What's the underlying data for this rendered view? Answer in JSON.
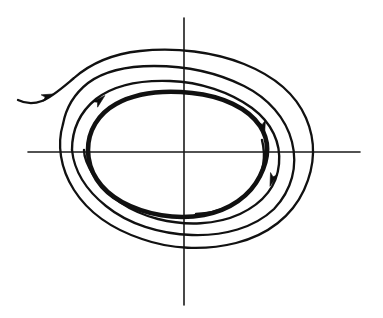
{
  "figure": {
    "background_color": "#ffffff",
    "stroke_color": "#111111",
    "width": 383,
    "height": 318
  },
  "axes": {
    "origin": {
      "x": 184,
      "y": 152
    },
    "horizontal": {
      "name": "x-axis",
      "x_start": 28,
      "x_end": 360,
      "y": 152,
      "label": "",
      "color": "#1a1a1a",
      "stroke_width": 1.6
    },
    "vertical": {
      "name": "y-axis",
      "y_start": 18,
      "y_end": 305,
      "x": 184,
      "label": "",
      "color": "#1a1a1a",
      "stroke_width": 1.6
    }
  },
  "curves": [
    {
      "id": "outer-spiral",
      "name": "outer-incoming-trajectory",
      "kind": "spiral-inward",
      "stroke_width": 2.3,
      "closed": false,
      "crossings": {
        "top_y": 53,
        "bottom_y": 245,
        "left_x": 62,
        "right_x": 308
      },
      "path": "M 18 100 C 26 104, 34 104, 42 101 C 52 97, 62 88, 74 78 C 90 64, 112 54, 140 51 C 176 47, 214 52, 244 64 C 274 76, 296 95, 306 118 C 316 141, 315 166, 304 190 C 292 216, 268 235, 236 243 C 204 251, 170 249, 142 239 C 112 229, 88 212, 74 190 C 60 168, 57 144, 63 124"
    },
    {
      "id": "mid-spiral",
      "name": "middle-incoming-trajectory",
      "kind": "spiral-inward",
      "stroke_width": 2.3,
      "closed": false,
      "crossings": {
        "top_y": 71,
        "bottom_y": 232,
        "left_x": 71,
        "right_x": 291
      },
      "path": "M 63 124 C 66 108, 74 94, 88 83 C 104 71, 128 66, 154 66 C 186 66, 216 72, 244 86 C 268 98, 286 118, 292 142 C 298 166, 292 190, 274 209 C 254 228, 224 236, 192 235 C 160 234, 128 224, 106 206 C 86 190, 74 170, 72 150"
    },
    {
      "id": "inner-spiral",
      "name": "inner-incoming-trajectory",
      "kind": "spiral-inward",
      "stroke_width": 2.4,
      "closed": false,
      "crossings": {
        "top_y": 88,
        "bottom_y": 222,
        "left_x": 88,
        "right_x": 278
      },
      "path": "M 72 150 C 72 130, 80 112, 96 99 C 114 85, 142 80, 170 81 C 200 82, 230 92, 252 108 C 272 123, 281 143, 279 164 C 277 186, 263 203, 240 214 C 216 225, 186 226, 158 219 C 130 212, 106 196, 94 176 C 87 165, 84 156, 84 150"
    },
    {
      "id": "limit-cycle",
      "name": "limit-cycle-closed-orbit",
      "kind": "closed-orbit",
      "stroke_width": 4.6,
      "closed": true,
      "crossings": {
        "top_y": 103,
        "bottom_y": 215,
        "left_x": 88,
        "right_x": 266
      },
      "path": "M 88 150 C 88 131, 98 114, 116 104 C 136 93, 164 90, 192 93 C 222 96, 248 108, 260 126 C 270 141, 269 158, 260 176 C 250 196, 230 210, 204 215 C 176 220, 146 215, 122 202 C 100 190, 88 171, 88 150 Z"
    },
    {
      "id": "core-spiral",
      "name": "inner-outgoing-trajectory",
      "kind": "spiral-outward",
      "stroke_width": 2.4,
      "closed": false,
      "crossings": {
        "right_x": 258
      },
      "path": "M 196 214 C 220 213, 242 203, 254 186 C 264 172, 266 156, 262 140"
    }
  ],
  "arrows": [
    {
      "id": "arrow-left-entry",
      "name": "flow-arrow-incoming-left",
      "x": 48,
      "y": 96,
      "angle_deg": -20,
      "direction": "right",
      "on_curve": "outer-spiral",
      "size": 11
    },
    {
      "id": "arrow-upper-left",
      "name": "flow-arrow-upper-left",
      "x": 100,
      "y": 100,
      "angle_deg": -42,
      "direction": "up-right",
      "on_curve": "limit-cycle",
      "size": 12
    },
    {
      "id": "arrow-right-upper",
      "name": "flow-arrow-right-upper",
      "x": 263,
      "y": 128,
      "angle_deg": 78,
      "direction": "down",
      "on_curve": "limit-cycle",
      "size": 13
    },
    {
      "id": "arrow-right-lower",
      "name": "flow-arrow-right-lower",
      "x": 272,
      "y": 180,
      "angle_deg": 108,
      "direction": "down-left",
      "on_curve": "inner-spiral",
      "size": 12
    }
  ]
}
